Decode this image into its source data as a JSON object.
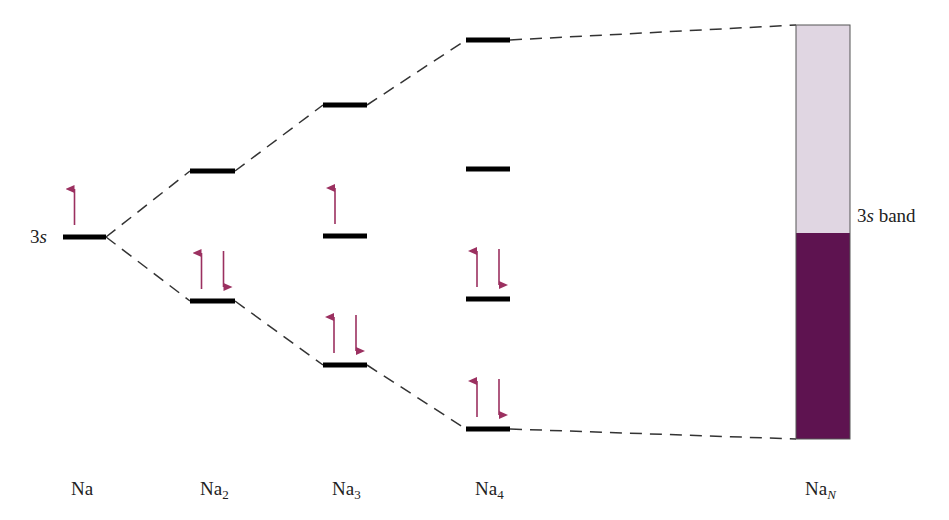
{
  "colors": {
    "level": "#000000",
    "dash": "#333333",
    "arrow": "#9b3060",
    "band_empty": "#e0d6e2",
    "band_filled": "#5e1350",
    "band_border": "#555555"
  },
  "labels": {
    "orbital": {
      "num": "3",
      "letter": "s"
    },
    "band": {
      "num": "3",
      "letter": "s",
      "word": " band"
    },
    "species": [
      {
        "base": "Na",
        "sub": ""
      },
      {
        "base": "Na",
        "sub": "2"
      },
      {
        "base": "Na",
        "sub": "3"
      },
      {
        "base": "Na",
        "sub": "4"
      },
      {
        "base": "Na",
        "sub": "N"
      }
    ]
  },
  "columns": [
    {
      "name": "Na",
      "x1": 63,
      "x2": 106,
      "levels": [
        {
          "y": 237,
          "electrons": "up"
        }
      ]
    },
    {
      "name": "Na2",
      "x1": 190,
      "x2": 235,
      "levels": [
        {
          "y": 171,
          "electrons": ""
        },
        {
          "y": 301,
          "electrons": "pair"
        }
      ]
    },
    {
      "name": "Na3",
      "x1": 323,
      "x2": 367,
      "levels": [
        {
          "y": 105,
          "electrons": ""
        },
        {
          "y": 236,
          "electrons": "up"
        },
        {
          "y": 365,
          "electrons": "pair"
        }
      ]
    },
    {
      "name": "Na4",
      "x1": 466,
      "x2": 510,
      "levels": [
        {
          "y": 40,
          "electrons": ""
        },
        {
          "y": 169,
          "electrons": ""
        },
        {
          "y": 299,
          "electrons": "pair"
        },
        {
          "y": 429,
          "electrons": "pair"
        }
      ]
    }
  ],
  "band": {
    "x1": 796,
    "x2": 850,
    "top": 25,
    "fill_top": 233,
    "bottom": 439
  }
}
